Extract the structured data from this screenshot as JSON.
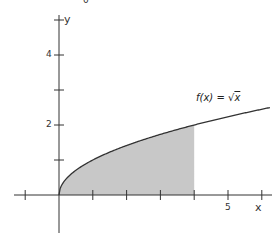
{
  "chart_data": {
    "type": "area",
    "title": "",
    "function_label": "f(x) = √x",
    "function_label_parts": {
      "lhs": "f(x)",
      "eq": "=",
      "rhs": "x"
    },
    "xlabel": "x",
    "ylabel": "y",
    "top_fragment_label": "0",
    "xlim": [
      -1,
      6.3
    ],
    "ylim": [
      -1.1,
      5
    ],
    "x_ticks": [
      -1,
      1,
      2,
      3,
      4,
      5,
      6
    ],
    "x_tick_labels": [
      {
        "value": 5,
        "label": "5"
      }
    ],
    "y_ticks": [
      1,
      2,
      3,
      4,
      5
    ],
    "y_tick_labels": [
      {
        "value": 2,
        "label": "2"
      },
      {
        "value": 4,
        "label": "4"
      }
    ],
    "curve": {
      "x": [
        0,
        0.25,
        1,
        2,
        3,
        4,
        5,
        6,
        6.24
      ],
      "y": [
        0,
        0.5,
        1,
        1.414,
        1.732,
        2,
        2.236,
        2.449,
        2.5
      ]
    },
    "shaded_region": {
      "from": 0,
      "to": 4,
      "color": "#c8c8c8"
    },
    "grid": false,
    "colors": {
      "axis": "#333333",
      "curve": "#333333",
      "fill": "#c8c8c8"
    }
  }
}
